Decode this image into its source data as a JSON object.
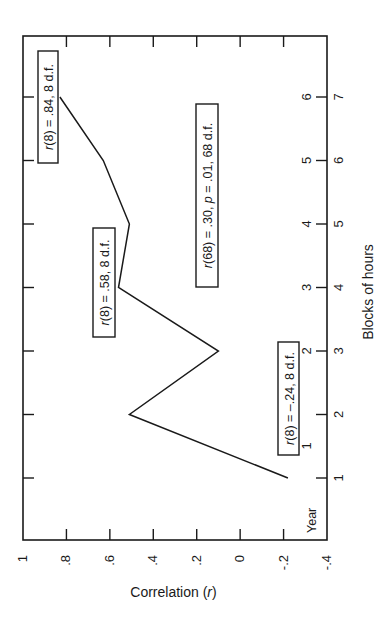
{
  "chart_data": {
    "type": "line",
    "orientation": "rotated-90",
    "title": "",
    "xlabel": "Correlation (r)",
    "ylabel": "Blocks of hours",
    "secondary_axis_label": "Year",
    "correlation_axis": {
      "ticks": [
        1,
        0.8,
        0.6,
        0.4,
        0.2,
        0,
        -0.2,
        -0.4
      ],
      "tick_labels": [
        "1",
        ".8",
        ".6",
        ".4",
        ".2",
        "0",
        "-.2",
        "-.4"
      ],
      "range": [
        1,
        -0.4
      ]
    },
    "year_axis": {
      "tick_labels": [
        "1",
        "2",
        "3",
        "4",
        "5",
        "6",
        "7"
      ]
    },
    "blocks_axis": {
      "tick_labels": [
        "1",
        "2",
        "3",
        "4",
        "5",
        "6"
      ]
    },
    "categories": [
      "1",
      "2",
      "3",
      "4",
      "5",
      "6",
      "7"
    ],
    "series": [
      {
        "name": "Correlation by year",
        "values": [
          -0.22,
          0.51,
          0.1,
          0.56,
          0.51,
          0.63,
          0.83
        ]
      }
    ],
    "annotations": [
      {
        "text": "r(8) = .84, 8 d.f.",
        "r_prefix": "r",
        "rest": "(8) = .84, 8 d.f."
      },
      {
        "text": "r(8) = .58, 8 d.f.",
        "r_prefix": "r",
        "rest": "(8) = .58, 8 d.f."
      },
      {
        "text": "r(68) = .30, p = .01, 68 d.f.",
        "r_prefix": "r",
        "rest": "(68) = .30, ",
        "p_prefix": "p",
        "rest2": " = .01, 68 d.f."
      },
      {
        "text": "r(8) = -.24, 8 d.f.",
        "r_prefix": "r",
        "rest": "(8) = –.24, 8 d.f."
      }
    ],
    "grid": false,
    "legend": "none"
  },
  "labels": {
    "correlation_prefix": "Correlation (",
    "correlation_r": "r",
    "correlation_suffix": ")"
  }
}
